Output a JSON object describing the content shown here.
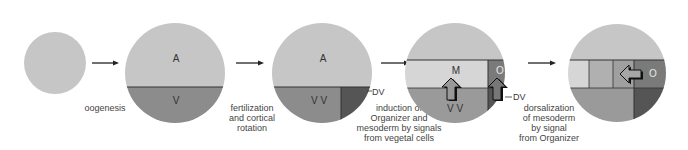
{
  "colors": {
    "animal": "#c6c6c6",
    "vegetal": "#8c8c8c",
    "dorsal_vegetal": "#555555",
    "mesoderm_light": "#d4d4d4",
    "mesoderm_mid": "#a9a9a9",
    "organizer": "#777777",
    "line": "#333333",
    "arrow_fill": "#999999",
    "arrow_outline": "#111111"
  },
  "stages": [
    {
      "id": "egg",
      "labels": []
    },
    {
      "id": "oocyte",
      "labels": {
        "top": "A",
        "bottom": "V"
      }
    },
    {
      "id": "fertilized",
      "labels": {
        "top": "A",
        "bottom": "V V",
        "side": "DV"
      }
    },
    {
      "id": "induction",
      "labels": {
        "mesoderm": "M",
        "organizer": "O",
        "bottom": "V V",
        "side": "DV"
      }
    },
    {
      "id": "dorsalization",
      "labels": {
        "organizer": "O"
      }
    }
  ],
  "captions": {
    "step1": [
      "oogenesis"
    ],
    "step2": [
      "fertilization",
      "and cortical",
      "rotation"
    ],
    "step3": [
      "induction of",
      "Organizer and",
      "mesoderm by signals",
      "from vegetal  cells"
    ],
    "step4": [
      "dorsalization",
      "of mesoderm",
      "by signal",
      "from Organizer"
    ]
  }
}
